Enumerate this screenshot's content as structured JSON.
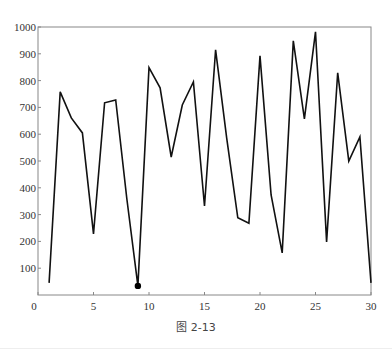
{
  "caption": "图 2-13",
  "chart_data": {
    "type": "line",
    "title": "",
    "xlabel": "",
    "ylabel": "",
    "x": [
      1,
      2,
      3,
      4,
      5,
      6,
      7,
      8,
      9,
      10,
      11,
      12,
      13,
      14,
      15,
      16,
      17,
      18,
      19,
      20,
      21,
      22,
      23,
      24,
      25,
      26,
      27,
      28,
      29,
      30
    ],
    "series": [
      {
        "name": "series",
        "color": "#111111",
        "values": [
          45,
          758,
          661,
          605,
          228,
          717,
          728,
          360,
          34,
          848,
          773,
          515,
          709,
          795,
          332,
          915,
          585,
          288,
          268,
          892,
          373,
          157,
          948,
          657,
          982,
          198,
          829,
          500,
          590,
          45
        ]
      }
    ],
    "highlight_point": {
      "x": 9,
      "y": 34
    },
    "xlim": [
      0,
      30
    ],
    "ylim": [
      0,
      1000
    ],
    "xticks": [
      0,
      5,
      10,
      15,
      20,
      25,
      30
    ],
    "yticks": [
      100,
      200,
      300,
      400,
      500,
      600,
      700,
      800,
      900,
      1000
    ],
    "grid": false,
    "legend": null
  }
}
